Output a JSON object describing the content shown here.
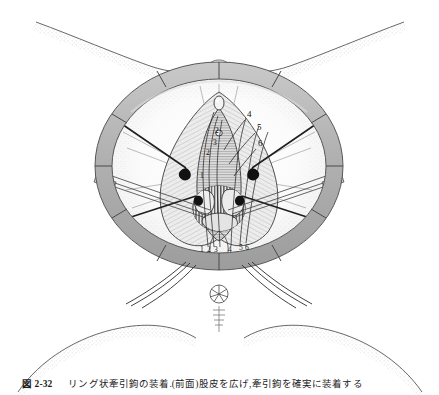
{
  "figure": {
    "view": "lithotomy position, perineum exposed",
    "background_color": "#ffffff",
    "ink_color": "#1d1d1d",
    "ring_fill": "#b5b5b5",
    "ring_stroke": "#5e5e5e",
    "tissue_shade": "#d7d7d7",
    "hatch_color": "#6a6a6a"
  },
  "retractor": {
    "name": "segmented self-retaining ring retractor",
    "segment_count": 12,
    "hook_count": 6,
    "center_x": 219,
    "center_y": 166,
    "outer_radius_x": 124,
    "outer_radius_y": 104,
    "band_width": 17
  },
  "labels": {
    "right_column": [
      {
        "id": "4",
        "text": "4",
        "x": 247,
        "y": 117
      },
      {
        "id": "5",
        "text": "5",
        "x": 257,
        "y": 130
      },
      {
        "id": "6",
        "text": "6",
        "x": 258,
        "y": 146
      }
    ],
    "center_column": [
      {
        "id": "2c",
        "text": "2",
        "x": 215,
        "y": 133
      },
      {
        "id": "3c",
        "text": "3",
        "x": 213,
        "y": 145
      },
      {
        "id": "2l",
        "text": "2",
        "x": 206,
        "y": 155
      },
      {
        "id": "1l",
        "text": "1",
        "x": 200,
        "y": 178
      }
    ],
    "bottom_row": [
      {
        "id": "b1",
        "text": "1",
        "x": 200,
        "y": 252
      },
      {
        "id": "b2",
        "text": "2",
        "x": 207,
        "y": 252
      },
      {
        "id": "b3",
        "text": "3",
        "x": 214,
        "y": 252
      },
      {
        "id": "b4",
        "text": "4",
        "x": 228,
        "y": 252
      },
      {
        "id": "b5",
        "text": "5",
        "x": 239,
        "y": 250
      },
      {
        "id": "b6",
        "text": "6",
        "x": 245,
        "y": 250
      }
    ]
  },
  "anatomy": {
    "anus_label": "anus",
    "anus_x": 219,
    "anus_y": 294,
    "left_thigh": "left thigh / buttock contour",
    "right_thigh": "right thigh / buttock contour",
    "lower_left_buttock": "lower left buttock contour",
    "lower_right_buttock": "lower right buttock contour"
  },
  "caption": {
    "label": "図 2-32",
    "text": "リング状牽引鉤の装着.(前面)股皮を広げ,牽引鉤を確実に装着する"
  }
}
